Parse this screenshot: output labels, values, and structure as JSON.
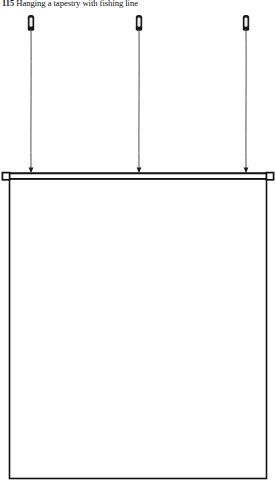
{
  "page": {
    "width": 276,
    "height": 491,
    "background": "#ffffff",
    "ink": "#111111"
  },
  "caption": {
    "figure_number": "115",
    "text": "Hanging a tapestry with fishing line",
    "full": "115 Hanging a tapestry with fishing line"
  },
  "figure": {
    "name": "tapestry-hanging-diagram",
    "stroke_color": "#111111",
    "nail_color": "#1c1c1c",
    "line_color": "#4a4a4a",
    "nails": [
      {
        "label": "left-nail",
        "x": 31,
        "y": 15,
        "head_width": 6,
        "head_height": 15
      },
      {
        "label": "center-nail",
        "x": 139,
        "y": 15,
        "head_width": 6,
        "head_height": 15
      },
      {
        "label": "right-nail",
        "x": 246,
        "y": 15,
        "head_width": 6,
        "head_height": 15
      }
    ],
    "fishing_lines": [
      {
        "label": "left-line",
        "x": 31,
        "top": 30,
        "bottom": 172
      },
      {
        "label": "center-line",
        "x": 139,
        "top": 30,
        "bottom": 172
      },
      {
        "label": "right-line",
        "x": 246,
        "top": 30,
        "bottom": 172
      }
    ],
    "rod": {
      "label": "hanging-rod",
      "left": 9,
      "right": 267,
      "y": 173,
      "thickness": 2
    },
    "finials": [
      {
        "label": "left-finial",
        "x": 9,
        "y": 176,
        "size": 6
      },
      {
        "label": "right-finial",
        "x": 267,
        "y": 176,
        "size": 6
      }
    ],
    "tapestry_panel": {
      "label": "tapestry-body",
      "left": 9,
      "right": 267,
      "top": 179,
      "bottom": 479,
      "fill": "#ffffff"
    }
  }
}
